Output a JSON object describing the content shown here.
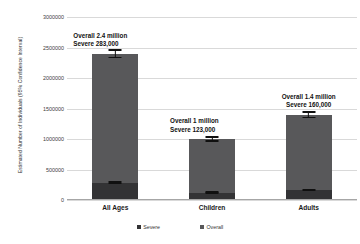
{
  "chart_data": {
    "type": "bar",
    "title": "",
    "subtitle": "",
    "xlabel": "",
    "ylabel": "Estimated Number of Individuals (95% Confidence Interval)",
    "ylim": [
      0,
      3000000
    ],
    "grid": true,
    "legend_position": "bottom",
    "categories": [
      "All Ages",
      "Children",
      "Adults"
    ],
    "y_ticks": [
      "0",
      "500000",
      "1000000",
      "1500000",
      "2000000",
      "2500000",
      "3000000"
    ],
    "y_tick_values": [
      0,
      500000,
      1000000,
      1500000,
      2000000,
      2500000,
      3000000
    ],
    "series": [
      {
        "name": "Severe",
        "color": "#333335",
        "values": [
          283000,
          123000,
          160000
        ]
      },
      {
        "name": "Overall",
        "color": "#58585a",
        "values": [
          2400000,
          1000000,
          1400000
        ]
      }
    ],
    "error_bars": {
      "Overall": [
        {
          "category": "All Ages",
          "low": 2330000,
          "high": 2470000
        },
        {
          "category": "Children",
          "low": 955000,
          "high": 1045000
        },
        {
          "category": "Adults",
          "low": 1345000,
          "high": 1455000
        }
      ],
      "Severe": [
        {
          "category": "All Ages",
          "low": 258000,
          "high": 308000
        },
        {
          "category": "Children",
          "low": 105000,
          "high": 141000
        },
        {
          "category": "Adults",
          "low": 140000,
          "high": 180000
        }
      ]
    },
    "annotations": [
      {
        "category": "All Ages",
        "line1": "Overall 2.4 million",
        "line2": "Severe 283,000"
      },
      {
        "category": "Children",
        "line1": "Overall 1 million",
        "line2": "Severe 123,000"
      },
      {
        "category": "Adults",
        "line1": "Overall 1.4 million",
        "line2": "Severe 160,000"
      }
    ]
  },
  "legend": {
    "entries": [
      {
        "label": "Severe",
        "color": "#333335"
      },
      {
        "label": "Overall",
        "color": "#58585a"
      }
    ]
  },
  "axis": {
    "y_title": "Estimated Number of Individuals (95% Confidence Interval)"
  }
}
